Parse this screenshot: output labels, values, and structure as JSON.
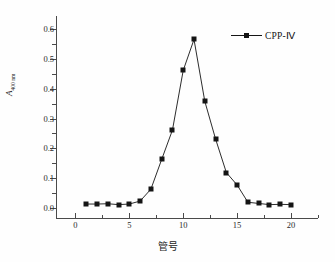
{
  "chart_data": {
    "type": "line",
    "title": "",
    "xlabel": "管号",
    "ylabel": "A",
    "ylabel_sub": "400 nm",
    "xlim": [
      -1.8,
      22.5
    ],
    "ylim": [
      -0.035,
      0.645
    ],
    "grid": false,
    "legend_position": "top-right",
    "xticks": [
      0,
      5,
      10,
      15,
      20
    ],
    "xtick_labels": [
      "0",
      "5",
      "10",
      "15",
      "20"
    ],
    "xminor_ticks": [
      2.5,
      7.5,
      12.5,
      17.5,
      22.5
    ],
    "yticks": [
      0.0,
      0.1,
      0.2,
      0.3,
      0.4,
      0.5,
      0.6
    ],
    "ytick_labels": [
      "0.0",
      "0.1",
      "0.2",
      "0.3",
      "0.4",
      "0.5",
      "0.6"
    ],
    "yminor_ticks": [
      0.05,
      0.15,
      0.25,
      0.35,
      0.45,
      0.55
    ],
    "series": [
      {
        "name": "CPP-Ⅳ",
        "marker": "filled-square",
        "color": "#141414",
        "x": [
          1,
          2,
          3,
          4,
          5,
          6,
          7,
          8,
          9,
          10,
          11,
          12,
          13,
          14,
          15,
          16,
          17,
          18,
          19,
          20
        ],
        "values": [
          0.012,
          0.012,
          0.013,
          0.01,
          0.012,
          0.022,
          0.062,
          0.162,
          0.261,
          0.462,
          0.566,
          0.358,
          0.231,
          0.118,
          0.076,
          0.018,
          0.014,
          0.01,
          0.011,
          0.01
        ]
      }
    ]
  },
  "legend": {
    "entries": [
      {
        "label": "CPP-Ⅳ"
      }
    ]
  }
}
